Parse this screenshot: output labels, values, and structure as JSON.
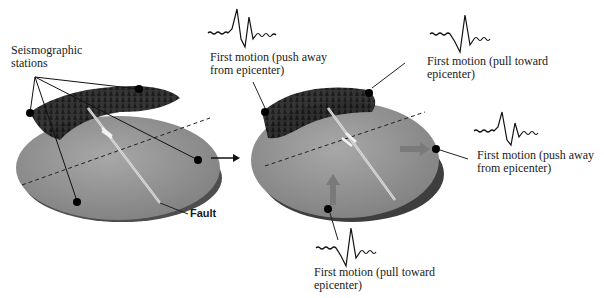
{
  "diagram": {
    "left_panel": {
      "stations_label_line1": "Seismographic",
      "stations_label_line2": "stations",
      "fault_label": "Fault",
      "station_count": 4
    },
    "transition_arrow": "right-arrow",
    "right_panel": {
      "annotations": [
        {
          "id": "top-left",
          "line1": "First motion (push away",
          "line2": "from epicenter)",
          "motion": "push"
        },
        {
          "id": "top-right",
          "line1": "First motion (pull toward",
          "line2": "epicenter)",
          "motion": "pull"
        },
        {
          "id": "right",
          "line1": "First motion (push away",
          "line2": "from epicenter)",
          "motion": "push"
        },
        {
          "id": "bottom",
          "line1": "First motion (pull toward",
          "line2": "epicenter)",
          "motion": "pull"
        }
      ]
    },
    "colors": {
      "ground": "#8f8f8f",
      "ground_light": "#a6a6a6",
      "side": "#5a5a5a",
      "trees": "#1e1e1e",
      "station": "#000000",
      "motion_arrow": "#7a7a7a",
      "text": "#1a1a1a"
    }
  }
}
